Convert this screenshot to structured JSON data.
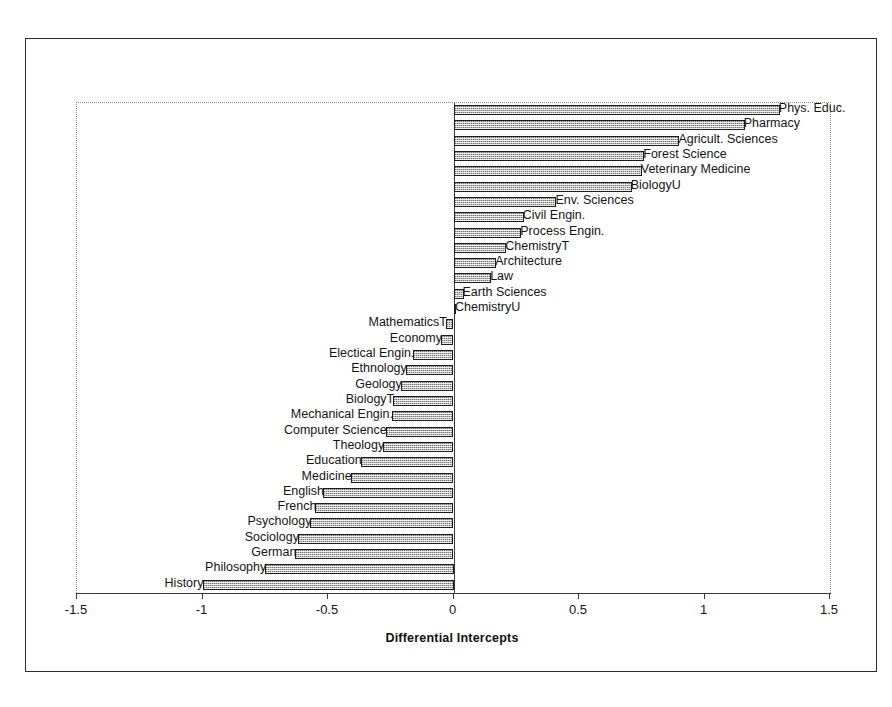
{
  "chart_data": {
    "type": "bar",
    "orientation": "horizontal",
    "title": "",
    "subtitle": "",
    "xlabel": "Differential Intercepts",
    "ylabel": "",
    "xlim": [
      -1.5,
      1.5
    ],
    "xticks": [
      -1.5,
      -1,
      -0.5,
      0,
      0.5,
      1,
      1.5
    ],
    "xticklabels": [
      "-1.5",
      "-1",
      "-0.5",
      "0",
      "0.5",
      "1",
      "1.5"
    ],
    "grid": false,
    "legend": null,
    "legend_position": "none",
    "zero_reference_line": 0,
    "bar_fill_color": "#b9b9b9",
    "bar_edge_color": "#1c1c1c",
    "frame_color": "#2b2b2b",
    "axis_color": "#3a3a3a",
    "n_categories": 32,
    "categories": [
      "Phys. Educ.",
      "Pharmacy",
      "Agricult. Sciences",
      "Forest Science",
      "Veterinary Medicine",
      "BiologyU",
      "Env. Sciences",
      "Civil Engin.",
      "Process Engin.",
      "ChemistryT",
      "Architecture",
      "Law",
      "Earth Sciences",
      "ChemistryU",
      "MathematicsT",
      "Economy",
      "Electical Engin.",
      "Ethnology",
      "Geology",
      "BiologyT",
      "Mechanical Engin.",
      "Computer Science",
      "Theology",
      "Education",
      "Medicine",
      "English",
      "French",
      "Psychology",
      "Sociology",
      "German",
      "Philosophy",
      "History"
    ],
    "values": [
      1.3,
      1.16,
      0.9,
      0.76,
      0.75,
      0.71,
      0.41,
      0.28,
      0.27,
      0.21,
      0.17,
      0.15,
      0.04,
      0.01,
      -0.03,
      -0.05,
      -0.16,
      -0.19,
      -0.21,
      -0.24,
      -0.245,
      -0.27,
      -0.28,
      -0.37,
      -0.41,
      -0.52,
      -0.55,
      -0.57,
      -0.62,
      -0.63,
      -0.75,
      -1.0
    ]
  }
}
